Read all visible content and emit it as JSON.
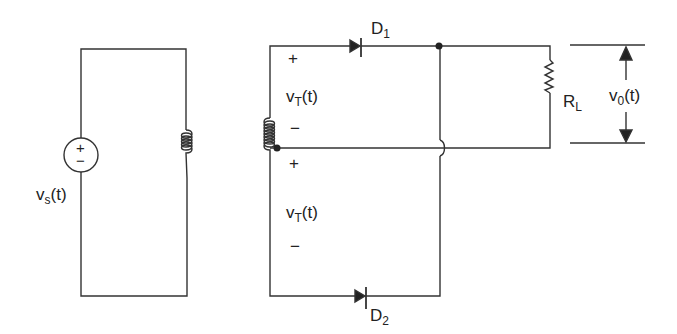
{
  "diagram": {
    "type": "center-tapped full-wave rectifier",
    "colors": {
      "stroke": "#333333",
      "background": "#ffffff"
    },
    "source": {
      "label_main": "v",
      "label_sub": "s",
      "label_tail": "(t)",
      "plus": "+",
      "minus": "−"
    },
    "transformer_upper": {
      "label_main": "v",
      "label_sub": "T",
      "label_tail": "(t)",
      "plus": "+",
      "minus": "−"
    },
    "transformer_lower": {
      "label_main": "v",
      "label_sub": "T",
      "label_tail": "(t)",
      "plus": "+",
      "minus": "−"
    },
    "diode_1": {
      "label_main": "D",
      "label_sub": "1"
    },
    "diode_2": {
      "label_main": "D",
      "label_sub": "2"
    },
    "load": {
      "label_main": "R",
      "label_sub": "L"
    },
    "output": {
      "label_main": "v",
      "label_sub": "0",
      "label_tail": "(t)"
    }
  }
}
